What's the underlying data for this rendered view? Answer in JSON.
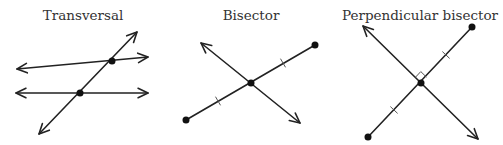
{
  "colors": {
    "line": "#222222",
    "text": "#333333",
    "background": "#ffffff"
  },
  "panels": [
    {
      "title": "Transversal",
      "title_x": 83,
      "lines": [
        {
          "kind": "line",
          "x1": 17,
          "y1": 69,
          "x2": 148,
          "y2": 57
        },
        {
          "kind": "line",
          "x1": 16,
          "y1": 93,
          "x2": 148,
          "y2": 93
        },
        {
          "kind": "line",
          "x1": 39,
          "y1": 134,
          "x2": 137,
          "y2": 32
        }
      ],
      "points": [
        {
          "x": 112,
          "y": 61
        },
        {
          "x": 80,
          "y": 93
        }
      ],
      "ticks": [],
      "right_angle": null
    },
    {
      "title": "Bisector",
      "title_x": 251,
      "lines": [
        {
          "kind": "segment",
          "x1": 186,
          "y1": 120,
          "x2": 315,
          "y2": 45
        },
        {
          "kind": "line",
          "x1": 201,
          "y1": 43,
          "x2": 300,
          "y2": 123
        }
      ],
      "points": [
        {
          "x": 186,
          "y": 120
        },
        {
          "x": 315,
          "y": 45
        },
        {
          "x": 251,
          "y": 83
        }
      ],
      "ticks": [
        {
          "x": 218,
          "y": 101
        },
        {
          "x": 283,
          "y": 63
        }
      ],
      "right_angle": null
    },
    {
      "title": "Perpendicular bisector",
      "title_x": 420,
      "lines": [
        {
          "kind": "segment",
          "x1": 368,
          "y1": 137,
          "x2": 472,
          "y2": 27
        },
        {
          "kind": "line",
          "x1": 363,
          "y1": 26,
          "x2": 478,
          "y2": 139
        }
      ],
      "points": [
        {
          "x": 368,
          "y": 137
        },
        {
          "x": 472,
          "y": 27
        },
        {
          "x": 421,
          "y": 83
        }
      ],
      "ticks": [
        {
          "x": 394,
          "y": 110
        },
        {
          "x": 446,
          "y": 55
        }
      ],
      "right_angle": {
        "x": 421,
        "y": 83
      }
    }
  ]
}
